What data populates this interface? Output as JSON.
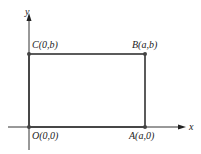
{
  "axes": {
    "x_label": "x",
    "y_label": "y"
  },
  "points": {
    "O": {
      "label": "O(0,0)"
    },
    "A": {
      "label": "A(a,0)"
    },
    "B": {
      "label": "B(a,b)"
    },
    "C": {
      "label": "C(0,b)"
    }
  },
  "colors": {
    "line": "#333333",
    "point": "#444444"
  }
}
